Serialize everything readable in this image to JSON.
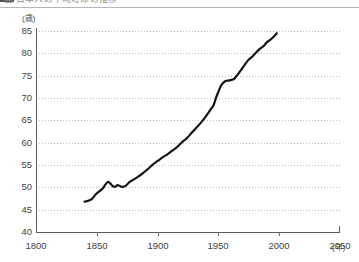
{
  "page": {
    "clipped_caption": "図 日本人の平均寿命の推移",
    "background": "#ffffff"
  },
  "chart_data": {
    "type": "line",
    "title": "",
    "subtitle": "",
    "xlabel": "(年)",
    "ylabel": "(歳)",
    "xlim": [
      1800,
      2050
    ],
    "ylim": [
      40,
      85
    ],
    "grid": true,
    "grid_axis": "y",
    "grid_style": "dotted",
    "legend": "none",
    "line_color": "#151515",
    "line_width": 2.2,
    "x_ticks": [
      "1800",
      "1850",
      "1900",
      "1950",
      "2000",
      "2050"
    ],
    "x_tick_values": [
      1800,
      1850,
      1900,
      1950,
      2000,
      2050
    ],
    "y_ticks": [
      "40",
      "45",
      "50",
      "55",
      "60",
      "65",
      "70",
      "75",
      "80",
      "85"
    ],
    "y_tick_values": [
      40,
      45,
      50,
      55,
      60,
      65,
      70,
      75,
      80,
      85
    ],
    "series": [
      {
        "name": "平均寿命",
        "x": [
          1840,
          1843,
          1846,
          1849,
          1851,
          1853,
          1855,
          1857,
          1859,
          1861,
          1863,
          1865,
          1867,
          1869,
          1871,
          1874,
          1877,
          1880,
          1884,
          1888,
          1892,
          1896,
          1900,
          1904,
          1908,
          1912,
          1916,
          1920,
          1924,
          1928,
          1932,
          1936,
          1940,
          1943,
          1946,
          1948,
          1950,
          1952,
          1954,
          1956,
          1958,
          1960,
          1963,
          1966,
          1969,
          1972,
          1975,
          1978,
          1981,
          1984,
          1987,
          1990,
          1993,
          1996,
          1998
        ],
        "y": [
          46.8,
          47.0,
          47.4,
          48.4,
          48.9,
          49.3,
          49.8,
          50.6,
          51.2,
          50.9,
          50.3,
          50.1,
          50.5,
          50.3,
          50.1,
          50.4,
          51.2,
          51.7,
          52.4,
          53.2,
          54.1,
          55.1,
          55.9,
          56.7,
          57.4,
          58.2,
          59.0,
          60.1,
          61.0,
          62.2,
          63.4,
          64.6,
          66.0,
          67.2,
          68.4,
          70.0,
          71.4,
          72.7,
          73.4,
          73.8,
          73.9,
          74.0,
          74.3,
          75.3,
          76.4,
          77.6,
          78.6,
          79.3,
          80.2,
          81.0,
          81.6,
          82.5,
          83.1,
          83.9,
          84.5
        ]
      }
    ]
  }
}
